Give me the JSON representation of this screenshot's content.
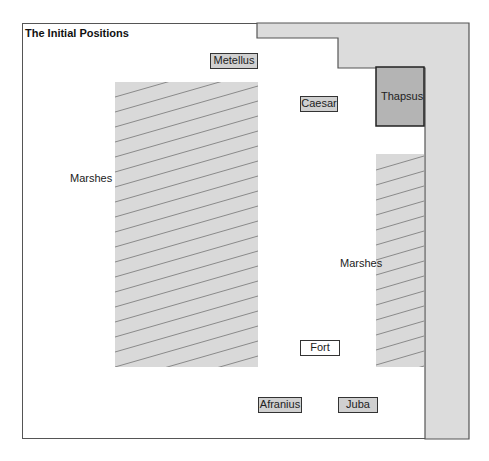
{
  "title": "The Initial Positions",
  "colors": {
    "sea": "#dcdcdc",
    "sea_border": "#555555",
    "marsh": "#d9d9d9",
    "hatch": "#8a8a8a",
    "town": "#b4b4b4",
    "unit_fill": "#d0d0d0"
  },
  "regions": {
    "sea": {
      "name": "sea"
    },
    "town": {
      "label": "Thapsus"
    },
    "marsh_left": {
      "label": "Marshes"
    },
    "marsh_right": {
      "label": "Marshes"
    }
  },
  "units": [
    {
      "label": "Metellus"
    },
    {
      "label": "Caesar"
    },
    {
      "label": "Fort"
    },
    {
      "label": "Afranius"
    },
    {
      "label": "Juba"
    }
  ]
}
